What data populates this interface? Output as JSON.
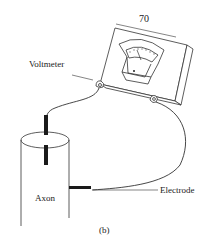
{
  "figure": {
    "panel_label": "(b)",
    "labels": {
      "meter_reading": "70",
      "voltmeter": "Voltmeter",
      "axon": "Axon",
      "electrode": "Electrode"
    },
    "colors": {
      "line": "#333333",
      "electrode": "#1a1a1a",
      "background": "#ffffff"
    }
  }
}
